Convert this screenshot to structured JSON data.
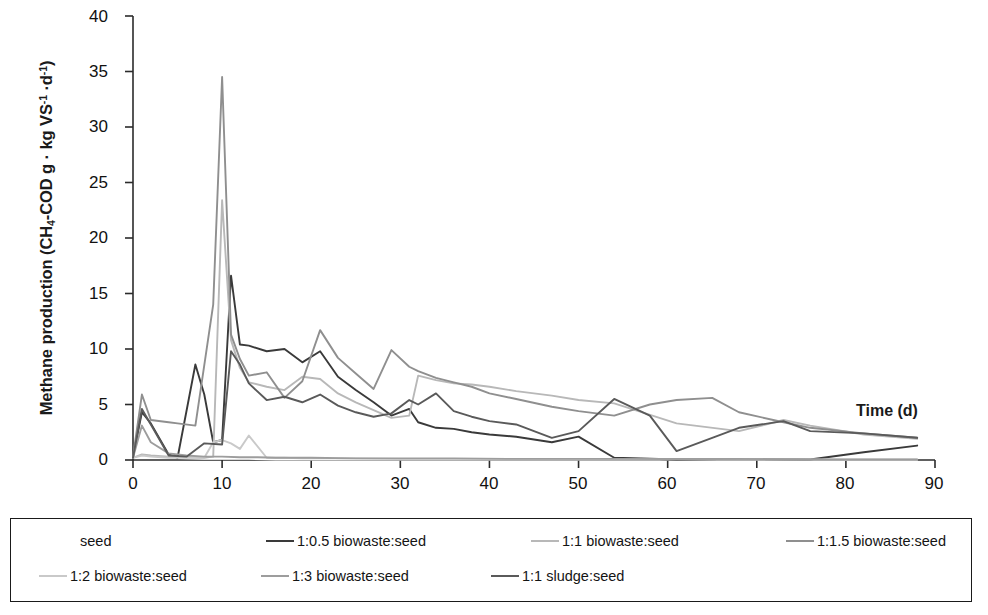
{
  "axes": {
    "ylabel_html": "Methane production (CH<sub>4</sub>-COD g &middot; kg VS<sup>-1</sup> &middot;d<sup>-1</sup>)",
    "ylabel_text": "Methane production (CH4-COD g · kg VS-1 ·d-1)",
    "xlabel": "Time (d)",
    "yticks": [
      "0",
      "5",
      "10",
      "15",
      "20",
      "25",
      "30",
      "35",
      "40"
    ],
    "xticks": [
      "0",
      "10",
      "20",
      "30",
      "40",
      "50",
      "60",
      "70",
      "80",
      "90"
    ]
  },
  "legend": {
    "rows": [
      [
        {
          "label": "seed",
          "color": "#ffffff",
          "swatch": false
        },
        {
          "label": "1:0.5 biowaste:seed",
          "color": "#3a3a3a",
          "swatch": true
        },
        {
          "label": "1:1 biowaste:seed",
          "color": "#b8b8b8",
          "swatch": true
        },
        {
          "label": "1:1.5 biowaste:seed",
          "color": "#8f8f8f",
          "swatch": true
        }
      ],
      [
        {
          "label": "1:2 biowaste:seed",
          "color": "#c9c9c9",
          "swatch": true
        },
        {
          "label": "1:3 biowaste:seed",
          "color": "#9d9d9d",
          "swatch": true
        },
        {
          "label": "1:1 sludge:seed",
          "color": "#5a5a5a",
          "swatch": true
        }
      ]
    ]
  },
  "chart_data": {
    "type": "line",
    "title": "",
    "xlabel": "Time (d)",
    "ylabel": "Methane production (CH4-COD g · kg VS-1 ·d-1)",
    "xlim": [
      0,
      90
    ],
    "ylim": [
      0,
      40
    ],
    "xticks": [
      0,
      10,
      20,
      30,
      40,
      50,
      60,
      70,
      80,
      90
    ],
    "yticks": [
      0,
      5,
      10,
      15,
      20,
      25,
      30,
      35,
      40
    ],
    "grid": false,
    "legend_position": "below-plot",
    "series": [
      {
        "name": "seed",
        "color": "#ffffff",
        "points": [
          [
            0,
            0.2
          ],
          [
            1,
            0.6
          ],
          [
            2,
            0.5
          ],
          [
            4,
            0.2
          ],
          [
            6,
            0.15
          ],
          [
            8,
            0.1
          ],
          [
            10,
            0.1
          ],
          [
            13,
            0.1
          ],
          [
            16,
            0.05
          ],
          [
            20,
            0.05
          ],
          [
            25,
            0.05
          ],
          [
            30,
            0.05
          ],
          [
            35,
            0.05
          ],
          [
            40,
            0.05
          ],
          [
            47,
            0.05
          ],
          [
            54,
            0.05
          ],
          [
            61,
            0.05
          ],
          [
            68,
            0.05
          ],
          [
            76,
            0.05
          ],
          [
            82,
            0.05
          ],
          [
            88,
            0.05
          ]
        ]
      },
      {
        "name": "1:0.5 biowaste:seed",
        "color": "#3a3a3a",
        "points": [
          [
            0,
            0.3
          ],
          [
            1,
            4.3
          ],
          [
            2,
            3.3
          ],
          [
            4,
            0.5
          ],
          [
            5,
            0.2
          ],
          [
            7,
            8.6
          ],
          [
            8,
            5.9
          ],
          [
            9,
            1.6
          ],
          [
            10,
            1.8
          ],
          [
            11,
            16.6
          ],
          [
            12,
            10.4
          ],
          [
            13,
            10.3
          ],
          [
            15,
            9.8
          ],
          [
            17,
            10.0
          ],
          [
            19,
            8.8
          ],
          [
            21,
            9.8
          ],
          [
            23,
            7.5
          ],
          [
            25,
            6.3
          ],
          [
            27,
            5.2
          ],
          [
            29,
            4.0
          ],
          [
            31,
            4.6
          ],
          [
            32,
            3.4
          ],
          [
            34,
            2.9
          ],
          [
            36,
            2.8
          ],
          [
            38,
            2.5
          ],
          [
            40,
            2.3
          ],
          [
            43,
            2.1
          ],
          [
            47,
            1.6
          ],
          [
            50,
            2.1
          ],
          [
            54,
            0.2
          ],
          [
            61,
            0.05
          ],
          [
            68,
            0.1
          ],
          [
            76,
            0.05
          ],
          [
            82,
            0.7
          ],
          [
            88,
            1.3
          ]
        ]
      },
      {
        "name": "1:1 biowaste:seed",
        "color": "#b8b8b8",
        "points": [
          [
            0,
            0.2
          ],
          [
            1,
            0.5
          ],
          [
            2,
            0.4
          ],
          [
            4,
            0.3
          ],
          [
            6,
            0.25
          ],
          [
            8,
            0.2
          ],
          [
            9,
            0.3
          ],
          [
            10,
            23.4
          ],
          [
            11,
            10.8
          ],
          [
            12,
            8.3
          ],
          [
            13,
            7.0
          ],
          [
            15,
            6.6
          ],
          [
            17,
            6.3
          ],
          [
            19,
            7.5
          ],
          [
            21,
            7.3
          ],
          [
            23,
            6.0
          ],
          [
            25,
            5.2
          ],
          [
            27,
            4.5
          ],
          [
            29,
            3.8
          ],
          [
            31,
            4.0
          ],
          [
            32,
            7.6
          ],
          [
            34,
            7.2
          ],
          [
            36,
            6.9
          ],
          [
            38,
            6.8
          ],
          [
            40,
            6.6
          ],
          [
            43,
            6.2
          ],
          [
            47,
            5.8
          ],
          [
            50,
            5.4
          ],
          [
            54,
            5.1
          ],
          [
            61,
            3.3
          ],
          [
            68,
            2.6
          ],
          [
            73,
            3.6
          ],
          [
            76,
            3.1
          ],
          [
            82,
            2.3
          ],
          [
            88,
            1.9
          ]
        ]
      },
      {
        "name": "1:1.5 biowaste:seed",
        "color": "#8f8f8f",
        "points": [
          [
            0,
            0.3
          ],
          [
            1,
            5.9
          ],
          [
            2,
            3.6
          ],
          [
            4,
            3.4
          ],
          [
            5,
            3.3
          ],
          [
            7,
            3.1
          ],
          [
            9,
            14.0
          ],
          [
            10,
            34.5
          ],
          [
            11,
            11.3
          ],
          [
            12,
            9.1
          ],
          [
            13,
            7.6
          ],
          [
            15,
            7.9
          ],
          [
            17,
            5.6
          ],
          [
            19,
            7.1
          ],
          [
            21,
            11.7
          ],
          [
            23,
            9.2
          ],
          [
            25,
            7.8
          ],
          [
            27,
            6.4
          ],
          [
            29,
            9.9
          ],
          [
            31,
            8.4
          ],
          [
            32,
            8.0
          ],
          [
            34,
            7.4
          ],
          [
            36,
            7.0
          ],
          [
            38,
            6.6
          ],
          [
            40,
            6.0
          ],
          [
            43,
            5.5
          ],
          [
            47,
            4.8
          ],
          [
            50,
            4.4
          ],
          [
            54,
            4.0
          ],
          [
            58,
            5.0
          ],
          [
            61,
            5.4
          ],
          [
            65,
            5.6
          ],
          [
            68,
            4.3
          ],
          [
            73,
            3.4
          ],
          [
            76,
            2.9
          ],
          [
            82,
            2.4
          ],
          [
            88,
            2.0
          ]
        ]
      },
      {
        "name": "1:2 biowaste:seed",
        "color": "#c9c9c9",
        "points": [
          [
            0,
            0.2
          ],
          [
            1,
            0.4
          ],
          [
            2,
            0.3
          ],
          [
            4,
            0.2
          ],
          [
            6,
            0.2
          ],
          [
            8,
            0.2
          ],
          [
            9,
            1.6
          ],
          [
            10,
            1.8
          ],
          [
            11,
            1.5
          ],
          [
            12,
            1.0
          ],
          [
            13,
            2.2
          ],
          [
            15,
            0.2
          ],
          [
            17,
            0.2
          ],
          [
            19,
            0.15
          ],
          [
            21,
            0.15
          ],
          [
            25,
            0.15
          ],
          [
            30,
            0.1
          ],
          [
            35,
            0.1
          ],
          [
            40,
            0.1
          ],
          [
            47,
            0.1
          ],
          [
            54,
            0.1
          ],
          [
            61,
            0.1
          ],
          [
            68,
            0.1
          ],
          [
            76,
            0.05
          ],
          [
            82,
            0.05
          ],
          [
            88,
            0.05
          ]
        ]
      },
      {
        "name": "1:3 biowaste:seed",
        "color": "#9d9d9d",
        "points": [
          [
            0,
            0.2
          ],
          [
            1,
            3.1
          ],
          [
            2,
            1.6
          ],
          [
            4,
            0.6
          ],
          [
            6,
            0.4
          ],
          [
            8,
            0.3
          ],
          [
            10,
            0.3
          ],
          [
            12,
            0.25
          ],
          [
            14,
            0.25
          ],
          [
            16,
            0.2
          ],
          [
            20,
            0.2
          ],
          [
            25,
            0.15
          ],
          [
            30,
            0.15
          ],
          [
            36,
            0.15
          ],
          [
            42,
            0.1
          ],
          [
            48,
            0.1
          ],
          [
            54,
            0.1
          ],
          [
            61,
            0.1
          ],
          [
            68,
            0.1
          ],
          [
            76,
            0.05
          ],
          [
            82,
            0.05
          ],
          [
            88,
            0.05
          ]
        ]
      },
      {
        "name": "1:1 sludge:seed",
        "color": "#5a5a5a",
        "points": [
          [
            0,
            0.2
          ],
          [
            1,
            4.6
          ],
          [
            2,
            3.2
          ],
          [
            4,
            0.4
          ],
          [
            6,
            0.3
          ],
          [
            8,
            1.5
          ],
          [
            10,
            1.4
          ],
          [
            11,
            9.8
          ],
          [
            12,
            8.6
          ],
          [
            13,
            6.9
          ],
          [
            15,
            5.4
          ],
          [
            17,
            5.7
          ],
          [
            19,
            5.2
          ],
          [
            21,
            5.9
          ],
          [
            23,
            4.9
          ],
          [
            25,
            4.3
          ],
          [
            27,
            3.9
          ],
          [
            29,
            4.2
          ],
          [
            31,
            5.4
          ],
          [
            32,
            5.0
          ],
          [
            34,
            6.0
          ],
          [
            36,
            4.4
          ],
          [
            38,
            3.9
          ],
          [
            40,
            3.5
          ],
          [
            43,
            3.2
          ],
          [
            47,
            2.0
          ],
          [
            50,
            2.6
          ],
          [
            54,
            5.5
          ],
          [
            58,
            4.0
          ],
          [
            61,
            0.8
          ],
          [
            65,
            2.0
          ],
          [
            68,
            2.9
          ],
          [
            73,
            3.5
          ],
          [
            76,
            2.6
          ],
          [
            82,
            2.4
          ],
          [
            88,
            2.0
          ]
        ]
      }
    ]
  }
}
